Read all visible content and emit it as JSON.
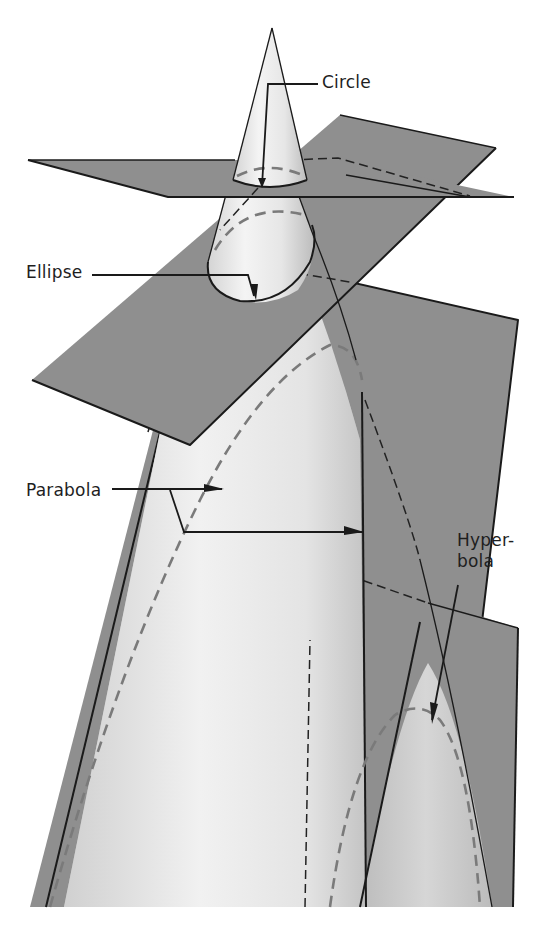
{
  "figure": {
    "labels": {
      "circle": "Circle",
      "ellipse": "Ellipse",
      "parabola": "Parabola",
      "hyperbola_line1": "Hyper-",
      "hyperbola_line2": "bola"
    }
  },
  "colors": {
    "background": "#ffffff",
    "plane_fill": "#8f8f8f",
    "cone_light": "#f2f2f2",
    "cone_mid": "#c8c8c8",
    "line": "#1a1a1a",
    "hidden_curve": "#7a7a7a"
  }
}
